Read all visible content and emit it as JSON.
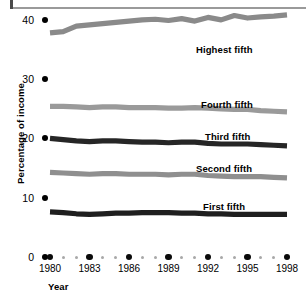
{
  "chart_data": {
    "type": "line",
    "title": "",
    "subtitle": "",
    "xlabel": "Year",
    "ylabel": "Percentage of income",
    "xlim": [
      1980,
      1998
    ],
    "ylim": [
      0,
      40
    ],
    "grid": false,
    "legend_position": "inline-right",
    "y_ticks": [
      {
        "value": 40,
        "label": "40"
      },
      {
        "value": 30,
        "label": "30"
      },
      {
        "value": 20,
        "label": "20"
      },
      {
        "value": 10,
        "label": "10"
      },
      {
        "value": 0,
        "label": "0"
      }
    ],
    "x_ticks_major": [
      {
        "value": 1980,
        "label": "1980"
      },
      {
        "value": 1983,
        "label": "1983"
      },
      {
        "value": 1986,
        "label": "1986"
      },
      {
        "value": 1989,
        "label": "1989"
      },
      {
        "value": 1992,
        "label": "1992"
      },
      {
        "value": 1995,
        "label": "1995"
      },
      {
        "value": 1998,
        "label": "1998"
      }
    ],
    "x_ticks_minor": [
      1981,
      1982,
      1984,
      1985,
      1987,
      1988,
      1990,
      1991,
      1993,
      1994,
      1996,
      1997
    ],
    "x": [
      1980,
      1981,
      1982,
      1983,
      1984,
      1985,
      1986,
      1987,
      1988,
      1989,
      1990,
      1991,
      1992,
      1993,
      1994,
      1995,
      1996,
      1997,
      1998
    ],
    "series": [
      {
        "name": "Highest fifth",
        "color": "#8a8a8a",
        "label": "Highest fifth",
        "values": [
          36.3,
          36.5,
          37.4,
          37.6,
          37.8,
          38.0,
          38.2,
          38.4,
          38.5,
          38.3,
          38.6,
          38.2,
          38.8,
          38.4,
          39.1,
          38.7,
          38.9,
          39.0,
          39.2
        ]
      },
      {
        "name": "Fourth fifth",
        "color": "#9a9a9a",
        "label": "Fourth fifth",
        "values": [
          24.4,
          24.4,
          24.3,
          24.2,
          24.3,
          24.3,
          24.2,
          24.2,
          24.2,
          24.1,
          24.1,
          24.2,
          24.1,
          24.0,
          23.9,
          23.9,
          23.7,
          23.6,
          23.5
        ]
      },
      {
        "name": "Third fifth",
        "color": "#262626",
        "label": "Third fifth",
        "values": [
          19.2,
          19.0,
          18.8,
          18.7,
          18.8,
          18.8,
          18.7,
          18.6,
          18.6,
          18.5,
          18.6,
          18.6,
          18.4,
          18.3,
          18.3,
          18.3,
          18.2,
          18.1,
          18.0
        ]
      },
      {
        "name": "Second fifth",
        "color": "#8f8f8f",
        "label": "Second fifth",
        "values": [
          13.7,
          13.6,
          13.5,
          13.4,
          13.5,
          13.5,
          13.4,
          13.4,
          13.4,
          13.3,
          13.4,
          13.4,
          13.2,
          13.1,
          13.0,
          13.0,
          13.0,
          12.9,
          12.8
        ]
      },
      {
        "name": "First fifth",
        "color": "#1f1f1f",
        "label": "First fifth",
        "values": [
          7.3,
          7.2,
          7.0,
          6.9,
          7.0,
          7.1,
          7.1,
          7.2,
          7.2,
          7.2,
          7.1,
          7.1,
          7.0,
          7.0,
          6.9,
          6.9,
          6.9,
          6.9,
          6.9
        ]
      }
    ]
  },
  "axis": {
    "y_title": "Percentage of income",
    "x_title": "Year"
  }
}
